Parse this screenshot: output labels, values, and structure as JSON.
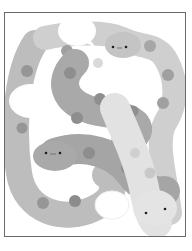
{
  "illustration": {
    "subject": "intertwined cartoon snakes with speech bubbles",
    "snakes": [
      {
        "id": "upper-right",
        "face": "• - •",
        "body_color": "#c4c4c4",
        "spot_color": "#a0a0a0"
      },
      {
        "id": "middle-left",
        "face": "• - •",
        "body_color": "#a9a9a9",
        "spot_color": "#8e8e8e"
      },
      {
        "id": "lower-right",
        "face": "•   •",
        "body_color": "#e2e2e2",
        "spot_color": "#c8c8c8"
      },
      {
        "id": "left-loop",
        "face": "",
        "body_color": "#bdbdbd",
        "spot_color": "#969696"
      }
    ],
    "speech_bubbles": [
      {
        "id": "top-center",
        "text": ""
      },
      {
        "id": "left",
        "text": ""
      },
      {
        "id": "bottom-center",
        "text": ""
      }
    ],
    "colors": {
      "frame_border": "#6a6a6a",
      "background": "#ffffff",
      "eye": "#1e1e1e"
    }
  }
}
